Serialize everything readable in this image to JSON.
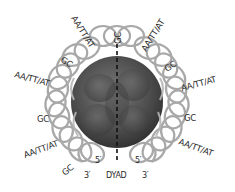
{
  "diagram": {
    "type": "nucleosome-dna-wrapping",
    "colors": {
      "background": "#ffffff",
      "dna_ribbon": "#a8a8a8",
      "histone_core": "#555555",
      "dyad_line": "#111111",
      "label_text": "#2a2a2a"
    },
    "top_label": "GC",
    "left_labels": [
      {
        "text": "AA/TT/AT",
        "angle": -60
      },
      {
        "text": "GC",
        "angle": -35
      },
      {
        "text": "AA/TT/AT",
        "angle": -15
      },
      {
        "text": "GC",
        "angle": 0
      },
      {
        "text": "AA/TT/AT",
        "angle": 20
      },
      {
        "text": "GC",
        "angle": 40
      }
    ],
    "right_labels": [
      {
        "text": "AA/TT/AT",
        "angle": -60
      },
      {
        "text": "GC",
        "angle": -35
      },
      {
        "text": "AA/TT/AT",
        "angle": -15
      },
      {
        "text": "GC",
        "angle": 0
      },
      {
        "text": "AA/TT/AT",
        "angle": 20
      }
    ],
    "bottom": {
      "left_5prime": "5′",
      "left_3prime": "3′",
      "dyad": "DYAD",
      "right_5prime": "5′",
      "right_3prime": "3′"
    }
  }
}
